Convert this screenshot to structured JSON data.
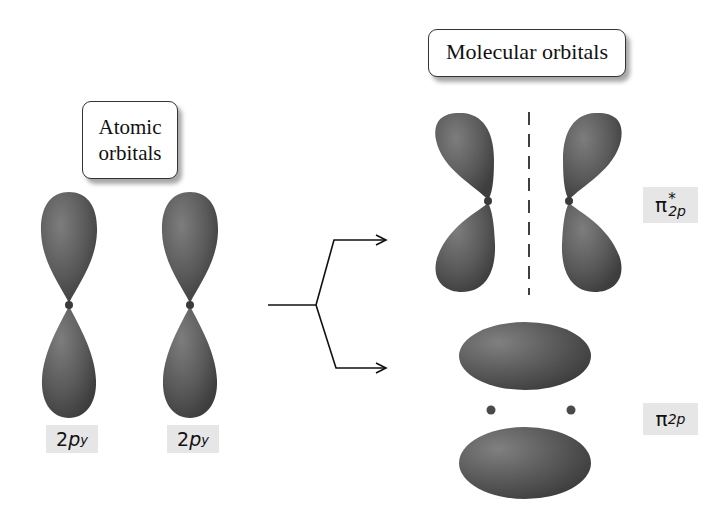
{
  "diagram": {
    "title_left": "Atomic orbitals",
    "title_left_lines": [
      "Atomic",
      "orbitals"
    ],
    "title_right": "Molecular orbitals",
    "atomic_orbitals": [
      {
        "label_main": "2",
        "label_p": "p",
        "label_sub": "y"
      },
      {
        "label_main": "2",
        "label_p": "p",
        "label_sub": "y"
      }
    ],
    "molecular_orbitals": [
      {
        "type": "antibonding",
        "symbol": "π",
        "superscript": "*",
        "subscript": "2p",
        "name": "pi-star-2p"
      },
      {
        "type": "bonding",
        "symbol": "π",
        "superscript": "",
        "subscript": "2p",
        "name": "pi-2p"
      }
    ],
    "colors": {
      "lobe": "#5a5a5a",
      "lobe_highlight": "#8a8a8a",
      "label_bg": "#e6e6e6",
      "line": "#111111"
    }
  }
}
